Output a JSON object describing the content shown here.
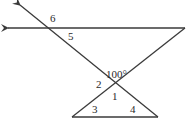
{
  "diagram": {
    "angle_labels": {
      "a6": "6",
      "a5": "5",
      "given": "100°",
      "a2": "2",
      "a1": "1",
      "a3": "3",
      "a4": "4"
    },
    "colors": {
      "line": "#3a3a3a",
      "text": "#2a2a2a"
    }
  }
}
